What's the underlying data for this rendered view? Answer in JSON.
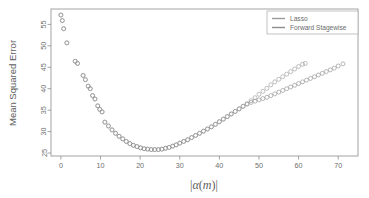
{
  "chart_data": {
    "type": "scatter",
    "title": "",
    "subtitle": "",
    "xlabel": "|α(m)|",
    "xlabel_parts": {
      "bar_left": "|",
      "alpha": "α",
      "paren_open": "(",
      "m": "m",
      "paren_close": ")",
      "bar_right": "|"
    },
    "ylabel": "Mean Squared Error",
    "xlim": [
      -2.5,
      75.0
    ],
    "ylim": [
      24.3,
      58.6
    ],
    "xticks": [
      0,
      10,
      20,
      30,
      40,
      50,
      60,
      70
    ],
    "xtick_labels": [
      "0",
      "10",
      "20",
      "30",
      "40",
      "50",
      "60",
      "70"
    ],
    "yticks": [
      25,
      30,
      35,
      40,
      45,
      50,
      55
    ],
    "ytick_labels": [
      "25",
      "30",
      "35",
      "40",
      "45",
      "50",
      "55"
    ],
    "grid": false,
    "frame": true,
    "marker": "open-circle",
    "marker_size": 2.0,
    "legend": {
      "position": "top-right",
      "entries": [
        {
          "name": "Lasso",
          "color": "#9a9a9a"
        },
        {
          "name": "Forward Stagewise",
          "color": "#8e8e8e"
        }
      ]
    },
    "series": [
      {
        "name": "Lasso",
        "color": "#9a9a9a",
        "points": [
          [
            0.0,
            57.2
          ],
          [
            0.35,
            55.9
          ],
          [
            0.7,
            54.0
          ],
          [
            1.5,
            50.7
          ],
          [
            3.6,
            46.4
          ],
          [
            4.2,
            45.9
          ],
          [
            5.6,
            43.1
          ],
          [
            6.2,
            42.1
          ],
          [
            6.9,
            40.6
          ],
          [
            7.4,
            40.0
          ],
          [
            8.0,
            38.4
          ],
          [
            8.6,
            37.6
          ],
          [
            9.3,
            36.0
          ],
          [
            9.8,
            35.2
          ],
          [
            10.4,
            34.6
          ],
          [
            11.1,
            32.2
          ],
          [
            12.0,
            31.3
          ],
          [
            12.9,
            30.4
          ],
          [
            13.8,
            29.6
          ],
          [
            14.7,
            28.9
          ],
          [
            15.6,
            28.3
          ],
          [
            16.5,
            27.7
          ],
          [
            17.4,
            27.2
          ],
          [
            18.3,
            26.8
          ],
          [
            19.2,
            26.5
          ],
          [
            20.1,
            26.2
          ],
          [
            21.0,
            26.0
          ],
          [
            21.9,
            25.9
          ],
          [
            22.8,
            25.8
          ],
          [
            23.7,
            25.8
          ],
          [
            24.6,
            25.8
          ],
          [
            25.5,
            25.9
          ],
          [
            26.4,
            26.1
          ],
          [
            27.3,
            26.3
          ],
          [
            28.2,
            26.6
          ],
          [
            29.1,
            26.9
          ],
          [
            30.0,
            27.3
          ],
          [
            31.0,
            27.7
          ],
          [
            32.0,
            28.1
          ],
          [
            33.0,
            28.6
          ],
          [
            34.0,
            29.1
          ],
          [
            35.0,
            29.6
          ],
          [
            36.0,
            30.1
          ],
          [
            37.0,
            30.6
          ],
          [
            38.0,
            31.1
          ],
          [
            39.0,
            31.7
          ],
          [
            40.0,
            32.3
          ],
          [
            41.0,
            32.9
          ],
          [
            42.0,
            33.5
          ],
          [
            43.0,
            34.1
          ],
          [
            44.0,
            34.7
          ],
          [
            45.0,
            35.3
          ],
          [
            46.0,
            35.9
          ],
          [
            47.0,
            36.5
          ],
          [
            48.0,
            37.2
          ],
          [
            49.0,
            37.9
          ],
          [
            50.0,
            38.7
          ],
          [
            51.0,
            39.4
          ],
          [
            52.0,
            40.1
          ],
          [
            53.0,
            40.9
          ],
          [
            54.0,
            41.6
          ],
          [
            55.0,
            42.2
          ],
          [
            56.0,
            42.8
          ],
          [
            57.0,
            43.4
          ],
          [
            58.0,
            44.0
          ],
          [
            59.0,
            44.6
          ],
          [
            60.0,
            45.2
          ],
          [
            61.0,
            45.7
          ],
          [
            61.7,
            45.9
          ]
        ]
      },
      {
        "name": "Forward Stagewise",
        "color": "#8e8e8e",
        "points": [
          [
            0.0,
            57.2
          ],
          [
            0.35,
            55.9
          ],
          [
            0.7,
            54.0
          ],
          [
            1.5,
            50.7
          ],
          [
            3.6,
            46.4
          ],
          [
            4.2,
            45.9
          ],
          [
            5.6,
            43.1
          ],
          [
            6.2,
            42.1
          ],
          [
            6.9,
            40.6
          ],
          [
            7.4,
            40.0
          ],
          [
            8.0,
            38.4
          ],
          [
            8.6,
            37.6
          ],
          [
            9.3,
            36.0
          ],
          [
            9.8,
            35.2
          ],
          [
            10.4,
            34.6
          ],
          [
            11.1,
            32.2
          ],
          [
            12.0,
            31.3
          ],
          [
            12.9,
            30.4
          ],
          [
            13.8,
            29.6
          ],
          [
            14.7,
            28.9
          ],
          [
            15.6,
            28.3
          ],
          [
            16.5,
            27.7
          ],
          [
            17.4,
            27.2
          ],
          [
            18.3,
            26.8
          ],
          [
            19.2,
            26.5
          ],
          [
            20.1,
            26.2
          ],
          [
            21.0,
            26.0
          ],
          [
            21.9,
            25.9
          ],
          [
            22.8,
            25.8
          ],
          [
            23.7,
            25.8
          ],
          [
            24.6,
            25.8
          ],
          [
            25.5,
            25.9
          ],
          [
            26.4,
            26.1
          ],
          [
            27.3,
            26.3
          ],
          [
            28.2,
            26.6
          ],
          [
            29.1,
            26.9
          ],
          [
            30.0,
            27.3
          ],
          [
            31.0,
            27.7
          ],
          [
            32.0,
            28.1
          ],
          [
            33.0,
            28.6
          ],
          [
            34.0,
            29.1
          ],
          [
            35.0,
            29.6
          ],
          [
            36.0,
            30.1
          ],
          [
            37.0,
            30.6
          ],
          [
            38.0,
            31.1
          ],
          [
            39.0,
            31.7
          ],
          [
            40.0,
            32.3
          ],
          [
            41.0,
            32.9
          ],
          [
            42.0,
            33.5
          ],
          [
            43.0,
            34.1
          ],
          [
            44.0,
            34.7
          ],
          [
            45.0,
            35.3
          ],
          [
            46.0,
            35.9
          ],
          [
            47.0,
            36.4
          ],
          [
            48.0,
            36.8
          ],
          [
            49.0,
            37.1
          ],
          [
            50.0,
            37.4
          ],
          [
            51.0,
            37.7
          ],
          [
            52.0,
            38.0
          ],
          [
            53.0,
            38.4
          ],
          [
            54.0,
            38.8
          ],
          [
            55.0,
            39.2
          ],
          [
            56.0,
            39.6
          ],
          [
            57.0,
            40.0
          ],
          [
            58.0,
            40.4
          ],
          [
            59.0,
            40.8
          ],
          [
            60.0,
            41.2
          ],
          [
            61.0,
            41.6
          ],
          [
            62.0,
            42.0
          ],
          [
            63.0,
            42.4
          ],
          [
            64.0,
            42.8
          ],
          [
            65.0,
            43.2
          ],
          [
            66.0,
            43.6
          ],
          [
            67.0,
            44.0
          ],
          [
            68.0,
            44.4
          ],
          [
            69.0,
            44.8
          ],
          [
            70.0,
            45.3
          ],
          [
            71.2,
            45.8
          ]
        ]
      }
    ]
  },
  "colors": {
    "frame": "#8d8d8d",
    "text": "#6b6b6b",
    "background": "#ffffff"
  }
}
